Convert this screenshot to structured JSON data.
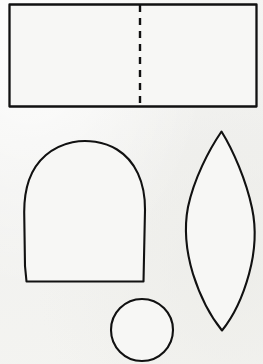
{
  "page": {
    "background_color": "#f3f3f1",
    "ink_color": "#111111",
    "width": 263,
    "height": 364
  },
  "shapes": [
    {
      "id": "rectangle-with-fold",
      "name": "Rectangle with dashed fold line",
      "type": "rectangle",
      "stroke": "solid",
      "x": 9,
      "y": 4,
      "width": 248,
      "height": 103,
      "fold_line": {
        "id": "dashed-fold-line",
        "name": "Dashed vertical fold line",
        "type": "line",
        "stroke": "dashed",
        "x": 140,
        "y1": 5,
        "y2": 106,
        "dash_length": 7,
        "dash_gap": 6
      }
    },
    {
      "id": "arch-dome",
      "name": "Arch / dome shape",
      "type": "arch",
      "stroke": "solid",
      "left": 24,
      "right": 145,
      "top": 141,
      "bottom": 282,
      "width": 121,
      "height": 141
    },
    {
      "id": "leaf-lens",
      "name": "Leaf / lens (vesica) shape",
      "type": "lens",
      "stroke": "solid",
      "left": 184,
      "right": 255,
      "top": 131,
      "bottom": 331,
      "width": 71,
      "height": 200,
      "tip_top_x": 221,
      "tip_bottom_x": 222
    },
    {
      "id": "circle",
      "name": "Circle",
      "type": "circle",
      "stroke": "solid",
      "center_x": 142,
      "center_y": 330,
      "radius": 31,
      "diameter": 62
    }
  ]
}
